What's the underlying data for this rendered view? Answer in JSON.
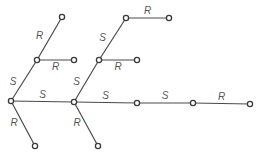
{
  "diagram": {
    "type": "tree",
    "nodes": [
      "A",
      "B",
      "C",
      "D",
      "E",
      "F",
      "G",
      "H",
      "I",
      "J",
      "K",
      "L",
      "M",
      "N"
    ],
    "edges": [
      {
        "from": "A",
        "to": "B",
        "label": "S"
      },
      {
        "from": "B",
        "to": "C",
        "label": "R"
      },
      {
        "from": "B",
        "to": "D",
        "label": "R"
      },
      {
        "from": "A",
        "to": "E",
        "label": "R"
      },
      {
        "from": "A",
        "to": "F",
        "label": "S"
      },
      {
        "from": "F",
        "to": "G",
        "label": "S"
      },
      {
        "from": "G",
        "to": "H",
        "label": "S"
      },
      {
        "from": "H",
        "to": "I",
        "label": "R"
      },
      {
        "from": "G",
        "to": "J",
        "label": "R"
      },
      {
        "from": "F",
        "to": "K",
        "label": "R"
      },
      {
        "from": "F",
        "to": "L",
        "label": "S"
      },
      {
        "from": "L",
        "to": "M",
        "label": "S"
      },
      {
        "from": "M",
        "to": "N",
        "label": "R"
      }
    ]
  }
}
